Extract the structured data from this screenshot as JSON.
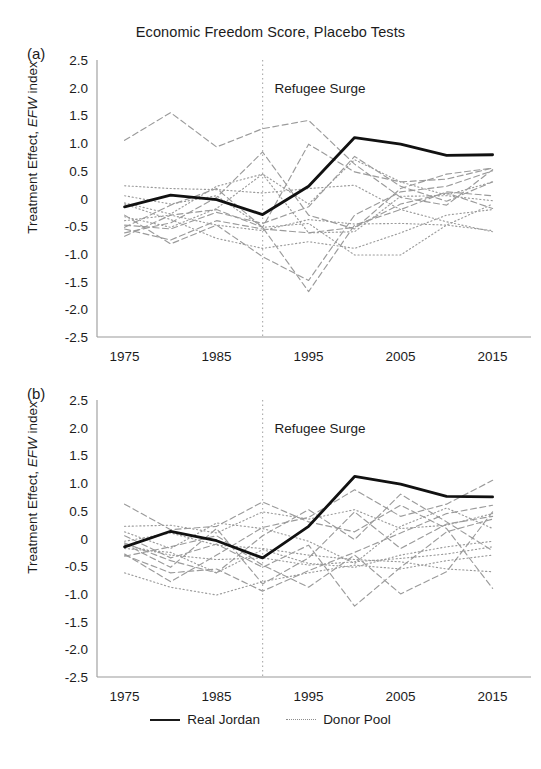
{
  "figure": {
    "title": "Economic Freedom Score, Placebo Tests",
    "panel_a_label": "(a)",
    "panel_b_label": "(b)",
    "axis_title_prefix": "Treatment Effect, ",
    "axis_title_italic": "EFW",
    "axis_title_suffix": " index",
    "event_annotation": "Refugee Surge"
  },
  "legend": {
    "position": "bottom-center",
    "entries": [
      {
        "label": "Real Jordan",
        "style": "solid",
        "color": "#1a1a1a"
      },
      {
        "label": "Donor Pool",
        "style": "dotted",
        "color": "#8d8d8d"
      }
    ]
  },
  "chart_data": [
    {
      "panel": "(a)",
      "type": "line",
      "title": "Economic Freedom Score, Placebo Tests",
      "xlabel": "",
      "ylabel": "Treatment Effect, EFW index",
      "xlim": [
        1972,
        2017
      ],
      "ylim": [
        -2.5,
        2.5
      ],
      "yticks": [
        "2.5",
        "2.0",
        "1.5",
        "1.0",
        "0.5",
        "0",
        "-0.5",
        "-1.0",
        "-1.5",
        "-2.0",
        "-2.5"
      ],
      "ytick_values": [
        2.5,
        2.0,
        1.5,
        1.0,
        0.5,
        0,
        -0.5,
        -1.0,
        -1.5,
        -2.0,
        -2.5
      ],
      "xticks": [
        "1975",
        "1985",
        "1995",
        "2005",
        "2015"
      ],
      "xtick_values": [
        1975,
        1985,
        1995,
        2005,
        2015
      ],
      "x": [
        1975,
        1980,
        1985,
        1990,
        1995,
        2000,
        2005,
        2010,
        2015
      ],
      "grid": false,
      "annotations": [
        {
          "text": "Refugee Surge",
          "x": 1990,
          "y": 2.0,
          "type": "vline-label"
        }
      ],
      "vline": {
        "x": 1990,
        "style": "dotted",
        "color": "#b0b0b0"
      },
      "series": [
        {
          "name": "Real Jordan",
          "style": "solid",
          "emphasis": true,
          "values": [
            -0.15,
            0.06,
            -0.02,
            -0.29,
            0.22,
            1.1,
            0.98,
            0.78,
            0.79
          ]
        },
        {
          "name": "Donor 1",
          "style": "dashed",
          "values": [
            1.05,
            1.55,
            0.93,
            1.26,
            1.41,
            0.62,
            0.02,
            -0.12,
            0.52
          ]
        },
        {
          "name": "Donor 2",
          "style": "dotted",
          "values": [
            0.23,
            0.18,
            0.16,
            0.1,
            0.18,
            0.24,
            -0.2,
            -0.42,
            -0.6
          ]
        },
        {
          "name": "Donor 3",
          "style": "dashed",
          "values": [
            -0.62,
            -0.44,
            0.02,
            0.84,
            -0.3,
            -0.55,
            0.18,
            0.44,
            0.55
          ]
        },
        {
          "name": "Donor 4",
          "style": "dotted",
          "values": [
            -0.33,
            -0.52,
            -0.18,
            0.44,
            -0.1,
            0.7,
            0.3,
            0.06,
            0.3
          ]
        },
        {
          "name": "Donor 5",
          "style": "dashed",
          "values": [
            -0.55,
            -0.75,
            -0.4,
            -0.55,
            -0.62,
            -0.52,
            -0.1,
            0.1,
            -0.18
          ]
        },
        {
          "name": "Donor 6",
          "style": "dotted",
          "values": [
            -0.4,
            -0.3,
            -0.48,
            -0.58,
            -0.38,
            -0.46,
            -0.45,
            -0.48,
            -0.58
          ]
        },
        {
          "name": "Donor 7",
          "style": "dashed",
          "values": [
            -0.3,
            -0.82,
            -0.48,
            -1.05,
            -1.48,
            -0.3,
            0.12,
            0.22,
            0.5
          ]
        },
        {
          "name": "Donor 8",
          "style": "dotted",
          "values": [
            -0.08,
            -0.28,
            0.22,
            0.44,
            -0.62,
            -0.6,
            0.04,
            0.05,
            -0.04
          ]
        },
        {
          "name": "Donor 9",
          "style": "dashed",
          "values": [
            -0.52,
            -0.12,
            0.18,
            -0.52,
            -1.68,
            -0.48,
            -0.2,
            0.12,
            0.05
          ]
        },
        {
          "name": "Donor 10",
          "style": "dotted",
          "values": [
            -0.1,
            -0.38,
            -0.72,
            -0.9,
            -0.78,
            -0.9,
            -0.62,
            -0.3,
            -0.2
          ]
        },
        {
          "name": "Donor 11",
          "style": "dashed",
          "values": [
            -0.48,
            -0.55,
            -0.25,
            -0.45,
            -0.15,
            0.76,
            0.22,
            -0.05,
            0.3
          ]
        },
        {
          "name": "Donor 12",
          "style": "dotted",
          "values": [
            0.05,
            -0.1,
            0.05,
            -0.52,
            -0.45,
            -1.02,
            -1.02,
            -0.48,
            -0.1
          ]
        },
        {
          "name": "Donor 13",
          "style": "dashed",
          "values": [
            -0.68,
            -0.3,
            -0.2,
            -0.52,
            0.98,
            0.48,
            0.3,
            0.35,
            0.55
          ]
        }
      ]
    },
    {
      "panel": "(b)",
      "type": "line",
      "title": "",
      "xlabel": "",
      "ylabel": "Treatment Effect, EFW index",
      "xlim": [
        1972,
        2017
      ],
      "ylim": [
        -2.5,
        2.5
      ],
      "yticks": [
        "2.5",
        "2.0",
        "1.5",
        "1.0",
        "0.5",
        "0",
        "-0.5",
        "-1.0",
        "-1.5",
        "-2.0",
        "-2.5"
      ],
      "ytick_values": [
        2.5,
        2.0,
        1.5,
        1.0,
        0.5,
        0,
        -0.5,
        -1.0,
        -1.5,
        -2.0,
        -2.5
      ],
      "xticks": [
        "1975",
        "1985",
        "1995",
        "2005",
        "2015"
      ],
      "xtick_values": [
        1975,
        1985,
        1995,
        2005,
        2015
      ],
      "x": [
        1975,
        1980,
        1985,
        1990,
        1995,
        2000,
        2005,
        2010,
        2015
      ],
      "grid": false,
      "annotations": [
        {
          "text": "Refugee Surge",
          "x": 1990,
          "y": 2.0,
          "type": "vline-label"
        }
      ],
      "vline": {
        "x": 1990,
        "style": "dotted",
        "color": "#b0b0b0"
      },
      "series": [
        {
          "name": "Real Jordan",
          "style": "solid",
          "emphasis": true,
          "values": [
            -0.15,
            0.13,
            -0.04,
            -0.35,
            0.22,
            1.12,
            0.98,
            0.76,
            0.75
          ]
        },
        {
          "name": "Donor 1",
          "style": "dashed",
          "values": [
            0.62,
            0.16,
            0.22,
            0.66,
            0.3,
            0.12,
            0.6,
            0.18,
            -0.9
          ]
        },
        {
          "name": "Donor 2",
          "style": "dotted",
          "values": [
            0.22,
            0.24,
            0.1,
            0.48,
            0.35,
            0.52,
            0.18,
            0.24,
            0.45
          ]
        },
        {
          "name": "Donor 3",
          "style": "dashed",
          "values": [
            -0.28,
            -0.78,
            -0.3,
            0.2,
            0.38,
            0.88,
            0.4,
            0.62,
            1.05
          ]
        },
        {
          "name": "Donor 4",
          "style": "dotted",
          "values": [
            -0.05,
            0.1,
            -0.12,
            -0.18,
            -0.3,
            -0.38,
            -0.42,
            -0.55,
            -0.6
          ]
        },
        {
          "name": "Donor 5",
          "style": "dashed",
          "values": [
            -0.1,
            -0.52,
            0.18,
            -0.82,
            -0.35,
            0.48,
            -0.18,
            0.26,
            0.4
          ]
        },
        {
          "name": "Donor 6",
          "style": "dotted",
          "values": [
            -0.12,
            -0.3,
            -0.38,
            -0.35,
            -0.48,
            -0.42,
            -0.36,
            -0.28,
            -0.15
          ]
        },
        {
          "name": "Donor 7",
          "style": "dashed",
          "values": [
            -0.3,
            -0.62,
            -0.55,
            -0.95,
            -0.58,
            -0.25,
            0.1,
            0.45,
            0.6
          ]
        },
        {
          "name": "Donor 8",
          "style": "dotted",
          "values": [
            -0.18,
            -0.25,
            -0.62,
            -0.2,
            -0.45,
            -0.52,
            -0.3,
            -0.15,
            -0.05
          ]
        },
        {
          "name": "Donor 9",
          "style": "dashed",
          "values": [
            0.05,
            -0.35,
            -0.1,
            -0.52,
            -0.12,
            -1.22,
            -0.52,
            0.12,
            0.35
          ]
        },
        {
          "name": "Donor 10",
          "style": "dotted",
          "values": [
            -0.62,
            -0.88,
            -1.02,
            -0.78,
            -0.62,
            -0.48,
            -0.55,
            -0.4,
            -0.3
          ]
        },
        {
          "name": "Donor 11",
          "style": "dashed",
          "values": [
            -0.08,
            -0.4,
            -0.62,
            0.05,
            0.52,
            -0.02,
            0.8,
            0.3,
            -0.22
          ]
        },
        {
          "name": "Donor 12",
          "style": "dotted",
          "values": [
            0.12,
            -0.18,
            0.28,
            0.18,
            -0.05,
            -0.45,
            0.22,
            0.55,
            0.18
          ]
        },
        {
          "name": "Donor 13",
          "style": "dashed",
          "values": [
            -0.32,
            -0.15,
            0.05,
            -0.48,
            -0.88,
            -0.3,
            -1.0,
            -0.6,
            0.48
          ]
        }
      ]
    }
  ]
}
